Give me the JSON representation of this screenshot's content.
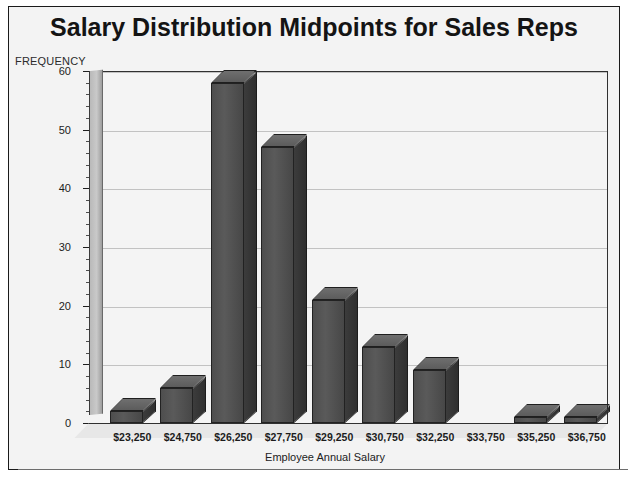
{
  "chart_data": {
    "type": "bar",
    "title": "Salary Distribution Midpoints for Sales Reps",
    "xlabel": "Employee Annual Salary",
    "ylabel": "FREQUENCY",
    "categories": [
      "$23,250",
      "$24,750",
      "$26,250",
      "$27,750",
      "$29,250",
      "$30,750",
      "$32,250",
      "$33,750",
      "$35,250",
      "$36,750"
    ],
    "values": [
      2,
      6,
      58,
      47,
      21,
      13,
      9,
      0,
      1,
      1
    ],
    "ylim": [
      0,
      60
    ],
    "y_ticks": [
      0,
      10,
      20,
      30,
      40,
      50,
      60
    ],
    "y_tick_labels": [
      "0",
      "10",
      "20",
      "30",
      "40",
      "50",
      "60"
    ],
    "y_minor_tick_step": 2,
    "grid": "horizontal",
    "legend": "none",
    "style": "3d-bars",
    "colors": {
      "bar_front": "#525252",
      "bar_side": "#363636",
      "bar_top": "#666666",
      "plot_background": "#f4f4f4",
      "frame_background": "#f3f3f3",
      "frame_border": "#1a1a1a",
      "gridline": "#c2c2c2",
      "text": "#1c1c1c"
    }
  },
  "chart": {
    "title": "Salary Distribution Midpoints for Sales Reps",
    "y_axis_title": "FREQUENCY",
    "x_axis_title": "Employee Annual Salary"
  }
}
